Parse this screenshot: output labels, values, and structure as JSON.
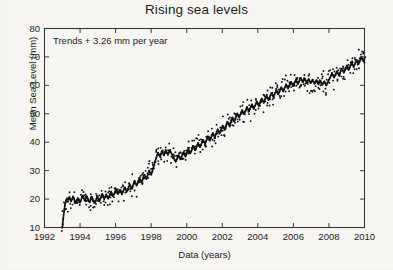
{
  "chart_data": {
    "type": "line",
    "title": "Rising sea levels",
    "xlabel": "Data (years)",
    "ylabel": "Mean Sea Level (mm)",
    "annotation": "Trends + 3.26 mm per year",
    "xlim": [
      1992,
      2010
    ],
    "ylim": [
      10,
      80
    ],
    "xticks": [
      1992,
      1994,
      1996,
      1998,
      2000,
      2002,
      2004,
      2006,
      2008,
      2010
    ],
    "yticks": [
      10,
      20,
      30,
      40,
      50,
      60,
      70,
      80
    ],
    "grid": false,
    "legend": null,
    "box_frame": true,
    "tick_direction": "in",
    "series": [
      {
        "name": "Mean sea level (connected record)",
        "marker": "dot",
        "line": true,
        "color": "#111111",
        "x": [
          1993.0,
          1993.05,
          1993.11,
          1993.16,
          1993.22,
          1993.27,
          1993.33,
          1993.38,
          1993.44,
          1993.49,
          1993.55,
          1993.6,
          1993.66,
          1993.71,
          1993.77,
          1993.82,
          1993.88,
          1993.93,
          1993.99,
          1994.04,
          1994.1,
          1994.15,
          1994.21,
          1994.26,
          1994.32,
          1994.37,
          1994.43,
          1994.48,
          1994.54,
          1994.59,
          1994.65,
          1994.7,
          1994.76,
          1994.81,
          1994.87,
          1994.92,
          1994.98,
          1995.03,
          1995.09,
          1995.14,
          1995.2,
          1995.25,
          1995.31,
          1995.36,
          1995.42,
          1995.47,
          1995.53,
          1995.58,
          1995.64,
          1995.69,
          1995.75,
          1995.8,
          1995.86,
          1995.91,
          1995.97,
          1996.02,
          1996.08,
          1996.13,
          1996.19,
          1996.24,
          1996.3,
          1996.35,
          1996.41,
          1996.46,
          1996.52,
          1996.57,
          1996.63,
          1996.68,
          1996.74,
          1996.79,
          1996.85,
          1996.9,
          1996.96,
          1997.01,
          1997.07,
          1997.12,
          1997.18,
          1997.23,
          1997.29,
          1997.34,
          1997.4,
          1997.45,
          1997.51,
          1997.56,
          1997.62,
          1997.67,
          1997.73,
          1997.78,
          1997.84,
          1997.89,
          1997.95,
          1998.0,
          1998.06,
          1998.11,
          1998.17,
          1998.22,
          1998.28,
          1998.33,
          1998.39,
          1998.44,
          1998.5,
          1998.55,
          1998.61,
          1998.66,
          1998.72,
          1998.77,
          1998.83,
          1998.88,
          1998.94,
          1998.99,
          1999.05,
          1999.1,
          1999.16,
          1999.21,
          1999.27,
          1999.32,
          1999.38,
          1999.43,
          1999.49,
          1999.54,
          1999.6,
          1999.65,
          1999.71,
          1999.76,
          1999.82,
          1999.87,
          1999.93,
          1999.98,
          2000.04,
          2000.09,
          2000.15,
          2000.2,
          2000.26,
          2000.31,
          2000.37,
          2000.42,
          2000.48,
          2000.53,
          2000.59,
          2000.64,
          2000.7,
          2000.75,
          2000.81,
          2000.86,
          2000.92,
          2000.97,
          2001.03,
          2001.08,
          2001.14,
          2001.19,
          2001.25,
          2001.3,
          2001.36,
          2001.41,
          2001.47,
          2001.52,
          2001.58,
          2001.63,
          2001.69,
          2001.74,
          2001.8,
          2001.85,
          2001.91,
          2001.96,
          2002.02,
          2002.07,
          2002.13,
          2002.18,
          2002.24,
          2002.29,
          2002.35,
          2002.4,
          2002.46,
          2002.51,
          2002.57,
          2002.62,
          2002.68,
          2002.73,
          2002.79,
          2002.84,
          2002.9,
          2002.95,
          2003.01,
          2003.06,
          2003.12,
          2003.17,
          2003.23,
          2003.28,
          2003.34,
          2003.39,
          2003.45,
          2003.5,
          2003.56,
          2003.61,
          2003.67,
          2003.72,
          2003.78,
          2003.83,
          2003.89,
          2003.94,
          2004.0,
          2004.05,
          2004.11,
          2004.16,
          2004.22,
          2004.27,
          2004.33,
          2004.38,
          2004.44,
          2004.49,
          2004.55,
          2004.6,
          2004.66,
          2004.71,
          2004.77,
          2004.82,
          2004.88,
          2004.93,
          2004.99,
          2005.04,
          2005.1,
          2005.15,
          2005.21,
          2005.26,
          2005.32,
          2005.37,
          2005.43,
          2005.48,
          2005.54,
          2005.59,
          2005.65,
          2005.7,
          2005.76,
          2005.81,
          2005.87,
          2005.92,
          2005.98,
          2006.03,
          2006.09,
          2006.14,
          2006.2,
          2006.25,
          2006.31,
          2006.36,
          2006.42,
          2006.47,
          2006.53,
          2006.58,
          2006.64,
          2006.69,
          2006.75,
          2006.8,
          2006.86,
          2006.91,
          2006.97,
          2007.02,
          2007.08,
          2007.13,
          2007.19,
          2007.24,
          2007.3,
          2007.35,
          2007.41,
          2007.46,
          2007.52,
          2007.57,
          2007.63,
          2007.68,
          2007.74,
          2007.79,
          2007.85,
          2007.9,
          2007.96,
          2008.01,
          2008.07,
          2008.12,
          2008.18,
          2008.23,
          2008.29,
          2008.34,
          2008.4,
          2008.45,
          2008.51,
          2008.56,
          2008.62,
          2008.67,
          2008.73,
          2008.78,
          2008.84,
          2008.89,
          2008.95,
          2009.0,
          2009.06,
          2009.11,
          2009.17,
          2009.22,
          2009.28,
          2009.33,
          2009.39,
          2009.44,
          2009.5,
          2009.55,
          2009.61,
          2009.66,
          2009.72,
          2009.77,
          2009.83,
          2009.88,
          2009.94,
          2009.99
        ],
        "y": [
          10.0,
          13.0,
          16.0,
          18.3,
          19.6,
          20.2,
          19.8,
          20.6,
          20.0,
          19.2,
          19.9,
          20.9,
          20.2,
          19.3,
          18.7,
          19.5,
          20.3,
          19.6,
          18.8,
          19.4,
          20.4,
          21.2,
          20.3,
          19.5,
          20.2,
          21.0,
          20.2,
          19.4,
          18.9,
          19.8,
          20.8,
          20.1,
          19.3,
          18.6,
          19.2,
          20.0,
          20.9,
          20.1,
          19.4,
          20.1,
          21.0,
          21.8,
          21.0,
          20.2,
          20.8,
          21.6,
          20.9,
          20.2,
          20.9,
          21.8,
          22.6,
          21.8,
          21.0,
          21.7,
          22.6,
          23.4,
          22.6,
          21.8,
          22.4,
          23.2,
          22.5,
          21.8,
          22.5,
          23.3,
          24.1,
          23.4,
          22.7,
          23.4,
          24.3,
          25.1,
          24.4,
          23.7,
          24.4,
          25.3,
          26.2,
          25.5,
          24.8,
          25.5,
          26.4,
          27.3,
          26.6,
          25.9,
          26.7,
          27.6,
          28.5,
          27.8,
          27.1,
          28.0,
          29.0,
          30.0,
          29.3,
          28.6,
          29.6,
          30.8,
          32.0,
          33.2,
          34.4,
          35.4,
          36.2,
          35.6,
          35.0,
          35.9,
          36.8,
          36.1,
          35.4,
          36.2,
          37.0,
          36.3,
          35.6,
          36.4,
          37.2,
          36.5,
          35.8,
          35.1,
          34.4,
          33.8,
          33.2,
          33.9,
          34.7,
          35.4,
          34.7,
          34.0,
          34.8,
          35.6,
          36.4,
          35.7,
          35.0,
          35.8,
          36.7,
          37.5,
          36.8,
          36.1,
          36.9,
          37.8,
          38.6,
          37.9,
          37.2,
          38.0,
          38.9,
          39.7,
          39.0,
          38.3,
          39.1,
          40.0,
          40.8,
          40.1,
          39.4,
          40.3,
          41.2,
          42.0,
          41.3,
          40.6,
          41.5,
          42.4,
          43.2,
          42.5,
          41.8,
          42.7,
          43.6,
          44.5,
          43.8,
          43.1,
          44.0,
          44.9,
          45.8,
          45.1,
          44.4,
          45.3,
          46.3,
          47.2,
          46.5,
          45.8,
          46.8,
          47.8,
          48.7,
          48.0,
          47.3,
          48.3,
          49.2,
          50.1,
          49.4,
          48.7,
          49.6,
          50.5,
          51.3,
          50.6,
          49.9,
          50.7,
          51.5,
          52.3,
          51.6,
          50.9,
          51.7,
          52.5,
          53.3,
          52.6,
          51.9,
          52.7,
          53.5,
          54.3,
          53.6,
          52.9,
          53.7,
          54.5,
          55.3,
          54.6,
          53.9,
          54.7,
          55.5,
          56.3,
          55.6,
          54.9,
          55.7,
          56.5,
          57.3,
          56.6,
          55.9,
          56.7,
          57.5,
          58.3,
          57.6,
          56.9,
          57.7,
          58.5,
          59.3,
          58.6,
          57.9,
          58.7,
          59.5,
          60.3,
          59.6,
          58.9,
          59.7,
          60.5,
          61.2,
          60.5,
          59.8,
          60.5,
          61.2,
          61.9,
          61.2,
          60.5,
          61.2,
          61.9,
          62.6,
          61.9,
          61.2,
          61.8,
          62.4,
          61.7,
          61.0,
          61.6,
          62.2,
          61.5,
          60.8,
          61.4,
          62.0,
          61.3,
          60.6,
          61.2,
          61.8,
          61.1,
          60.4,
          61.0,
          61.6,
          60.9,
          60.2,
          60.8,
          61.4,
          60.7,
          60.0,
          60.7,
          61.4,
          62.1,
          62.8,
          63.5,
          64.2,
          63.5,
          62.8,
          63.5,
          64.2,
          64.9,
          64.2,
          63.5,
          64.3,
          65.1,
          65.9,
          65.2,
          64.5,
          65.3,
          66.1,
          66.9,
          66.2,
          65.5,
          66.3,
          67.1,
          67.9,
          67.2,
          66.5,
          67.3,
          68.1,
          68.9,
          68.2,
          67.5,
          68.3,
          69.1,
          69.9,
          69.2,
          68.5,
          69.3
        ],
        "scatter_spread_mm": 2.2,
        "scatter_note": "Individual dots scatter roughly +/- 2-3 mm about the connected trace"
      }
    ],
    "trend_line": {
      "slope_mm_per_year": 3.26,
      "description": "Linear trend of +3.26 mm per year stated in annotation"
    }
  }
}
